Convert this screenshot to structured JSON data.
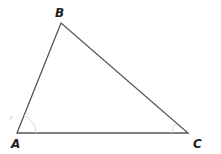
{
  "diagram": {
    "type": "triangle",
    "vertices": [
      {
        "name": "A",
        "x": 17,
        "y": 133,
        "label_x": 11,
        "label_y": 148
      },
      {
        "name": "B",
        "x": 61,
        "y": 23,
        "label_x": 55,
        "label_y": 17
      },
      {
        "name": "C",
        "x": 188,
        "y": 133,
        "label_x": 193,
        "label_y": 148
      }
    ],
    "angle_marks": [
      "A",
      "C"
    ],
    "colors": {
      "line": "#555555",
      "arc": "#d8d8d8",
      "label": "#222222",
      "background": "#ffffff"
    }
  }
}
